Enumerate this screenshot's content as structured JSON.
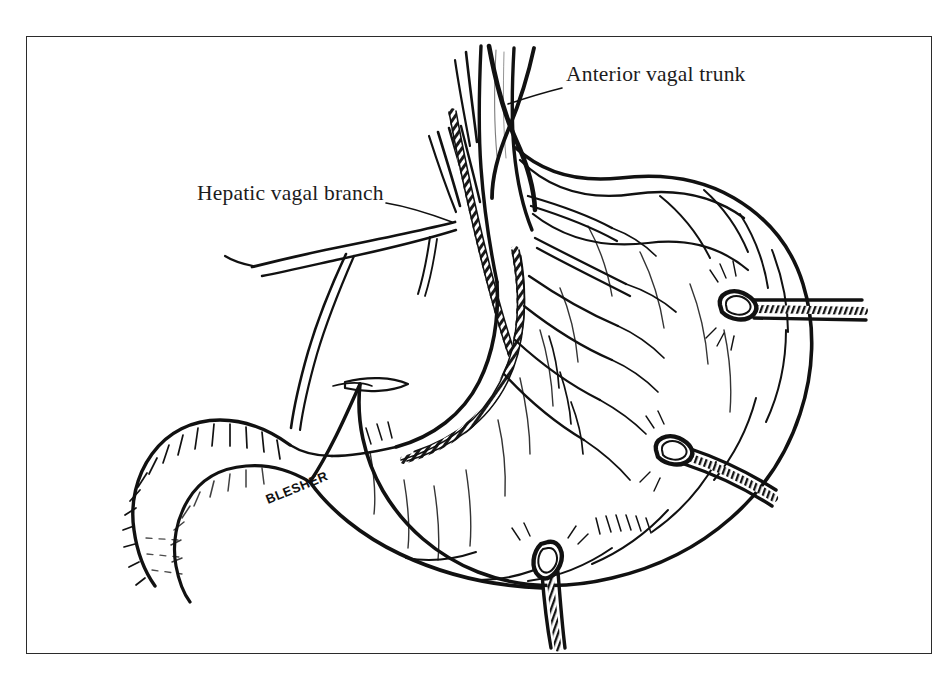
{
  "figure": {
    "domain": "anatomical-line-illustration",
    "style": "black-and-white pen-and-ink medical illustration",
    "background_color": "#ffffff",
    "ink_color": "#111111",
    "frame": {
      "visible": true,
      "border_color": "#2b2b2b",
      "x": 26,
      "y": 36,
      "width": 906,
      "height": 618
    },
    "signature": {
      "text": "BLESHER",
      "x": 268,
      "y": 497,
      "rotation_deg": -22
    }
  },
  "labels": [
    {
      "id": "anterior-vagal-trunk",
      "text": "Anterior vagal trunk",
      "x": 566,
      "y": 64,
      "leader_from": [
        560,
        88
      ],
      "leader_to": [
        508,
        104
      ]
    },
    {
      "id": "hepatic-vagal-branch",
      "text": "Hepatic vagal branch",
      "x": 197,
      "y": 183,
      "leader_from": [
        385,
        204
      ],
      "leader_to": [
        452,
        222
      ]
    }
  ],
  "structures": [
    {
      "id": "esophagus",
      "name": "Esophagus",
      "note": "vertical tube entering at top center"
    },
    {
      "id": "stomach-body",
      "name": "Stomach body and fundus",
      "note": "large rounded mass right of center"
    },
    {
      "id": "lesser-curvature",
      "name": "Lesser curvature",
      "note": "concave left border carrying stippled neurovascular bundle"
    },
    {
      "id": "greater-curvature",
      "name": "Greater curvature",
      "note": "convex lower-right border"
    },
    {
      "id": "antrum",
      "name": "Antrum / pylorus",
      "note": "lower left narrowing toward duodenum"
    },
    {
      "id": "duodenum",
      "name": "Duodenum",
      "note": "hatched C-shaped segment at far left"
    },
    {
      "id": "anterior-vagal-trunk",
      "name": "Anterior vagal trunk",
      "note": "descends on anterior esophagus onto lesser curvature"
    },
    {
      "id": "hepatic-vagal-branch",
      "name": "Hepatic vagal branch",
      "note": "branches left toward the liver"
    },
    {
      "id": "gastric-vagal-branches",
      "name": "Anterior gastric vagal branches",
      "note": "fan of fine nerve twigs over the stomach wall"
    }
  ],
  "ligatures": [
    {
      "id": "ligature-upper-right",
      "label": "ligature clamp",
      "x": 740,
      "y": 305,
      "tail_direction": "right"
    },
    {
      "id": "ligature-mid-right",
      "label": "ligature clamp",
      "x": 676,
      "y": 450,
      "tail_direction": "right-down"
    },
    {
      "id": "ligature-bottom-center",
      "label": "ligature clamp",
      "x": 548,
      "y": 562,
      "tail_direction": "down"
    }
  ]
}
